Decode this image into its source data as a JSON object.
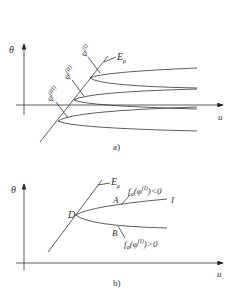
{
  "figure_a": {
    "caption": "a)",
    "y_axis_label": "θ",
    "x_axis_label": "u",
    "boundary_label": "E",
    "boundary_sub": "ρ",
    "branch_labels": [
      {
        "base": "φ",
        "sup": "(I)"
      },
      {
        "base": "φ",
        "sup": "(II)"
      },
      {
        "base": "φ",
        "sup": "(III)"
      }
    ]
  },
  "figure_b": {
    "caption": "b)",
    "y_axis_label": "θ",
    "x_axis_label": "u",
    "boundary_label": "E",
    "boundary_sub": "ρ",
    "point_D": "D",
    "point_A": "A",
    "point_B": "B",
    "curve_end_label": "I",
    "upper_condition": {
      "f": "f",
      "sub": "φ",
      "open": "(φ",
      "sup": "(I)",
      "close": ")<0"
    },
    "lower_condition": {
      "f": "f",
      "sub": "φ",
      "open": "(φ",
      "sup": "(I)",
      "close": ")>0"
    }
  }
}
